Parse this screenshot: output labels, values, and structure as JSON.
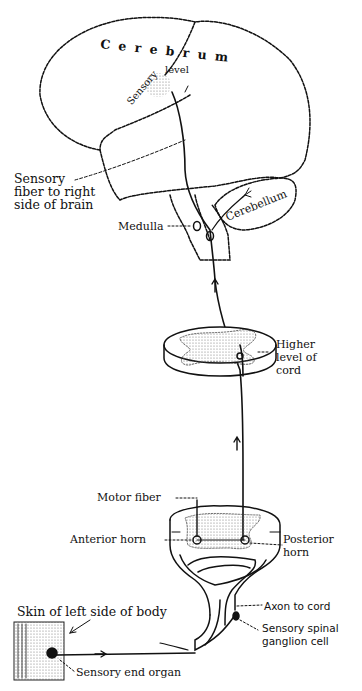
{
  "figure": {
    "labels": {
      "cerebrum": "C e r e b r u m",
      "sensory_level_1": "Sensory",
      "sensory_level_2": "level",
      "sensory_fiber_1": "Sensory",
      "sensory_fiber_2": "fiber to right",
      "sensory_fiber_3": "side of brain",
      "medulla": "Medulla",
      "cerebellum": "Cerebellum",
      "higher_1": "Higher",
      "higher_2": "level of",
      "higher_3": "cord",
      "motor_fiber": "Motor fiber",
      "anterior_horn": "Anterior horn",
      "posterior_1": "Posterior",
      "posterior_2": "horn",
      "skin": "Skin of left side of body",
      "axon": "Axon to cord",
      "ganglion_1": "Sensory spinal",
      "ganglion_2": "ganglion cell",
      "end_organ": "Sensory end organ"
    },
    "colors": {
      "ink": "#111111",
      "background": "#ffffff",
      "stipple": "#9a9a9a"
    }
  }
}
